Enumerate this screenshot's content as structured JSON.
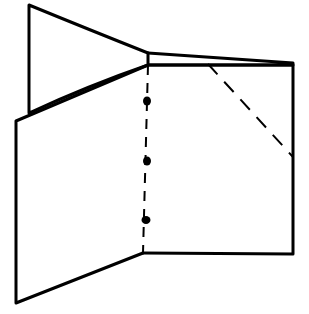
{
  "diagram": {
    "type": "fold-instruction",
    "stroke_color": "#000000",
    "background": "#ffffff",
    "shapes": {
      "back_flap": [
        [
          29,
          5
        ],
        [
          148,
          53
        ],
        [
          148,
          65
        ],
        [
          29,
          113
        ]
      ],
      "left_panel": [
        [
          16,
          121
        ],
        [
          148,
          65
        ],
        [
          143,
          253
        ],
        [
          16,
          303
        ]
      ],
      "right_panel": [
        [
          148,
          65
        ],
        [
          293,
          65
        ],
        [
          293,
          254
        ],
        [
          143,
          253
        ]
      ],
      "top_sliver": [
        [
          148,
          53
        ],
        [
          293,
          63
        ],
        [
          293,
          65
        ],
        [
          148,
          65
        ]
      ]
    },
    "fold_lines": {
      "valley_dashed": {
        "from": [
          208,
          64
        ],
        "to": [
          293,
          157
        ]
      },
      "center_dash_dot": {
        "from": [
          148,
          65
        ],
        "to": [
          143,
          253
        ]
      }
    },
    "dots": [
      [
        147,
        101
      ],
      [
        147,
        161
      ],
      [
        146,
        220
      ]
    ]
  }
}
